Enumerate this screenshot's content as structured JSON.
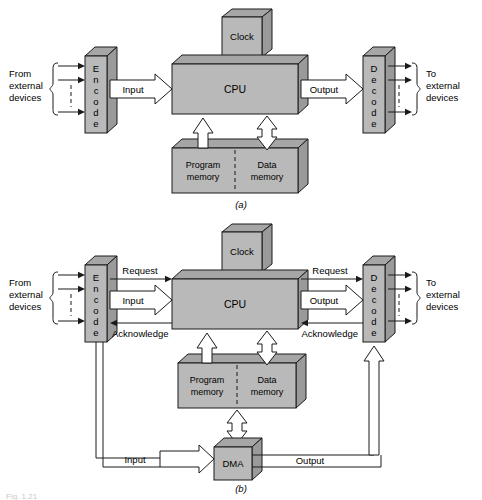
{
  "figure": {
    "caption_bottom": "Fig. 1.21",
    "panels": [
      {
        "id": "a",
        "label": "(a)"
      },
      {
        "id": "b",
        "label": "(b)"
      }
    ]
  },
  "panel_a": {
    "blocks": {
      "clock": "Clock",
      "cpu": "CPU",
      "encode": "Encode",
      "decode": "Decode",
      "program_memory_line1": "Program",
      "program_memory_line2": "memory",
      "data_memory_line1": "Data",
      "data_memory_line2": "memory"
    },
    "signals": {
      "input": "Input",
      "output": "Output"
    },
    "external": {
      "from_line1": "From",
      "from_line2": "external",
      "from_line3": "devices",
      "to_line1": "To",
      "to_line2": "external",
      "to_line3": "devices"
    }
  },
  "panel_b": {
    "blocks": {
      "clock": "Clock",
      "cpu": "CPU",
      "encode": "Encode",
      "decode": "Decode",
      "dma": "DMA",
      "program_memory_line1": "Program",
      "program_memory_line2": "memory",
      "data_memory_line1": "Data",
      "data_memory_line2": "memory"
    },
    "signals": {
      "request_left": "Request",
      "input_left": "Input",
      "acknowledge_left": "Acknowledge",
      "request_right": "Request",
      "output_right": "Output",
      "acknowledge_right": "Acknowledge",
      "dma_input": "Input",
      "dma_output": "Output"
    },
    "external": {
      "from_line1": "From",
      "from_line2": "external",
      "from_line3": "devices",
      "to_line1": "To",
      "to_line2": "external",
      "to_line3": "devices"
    }
  },
  "colors": {
    "block_front": "#b9b9b9",
    "block_top": "#a6a6a6",
    "block_side": "#9a9a9a",
    "outline": "#1a1a1a",
    "arrow_fill": "#ffffff",
    "page_bg": "#ffffff"
  }
}
